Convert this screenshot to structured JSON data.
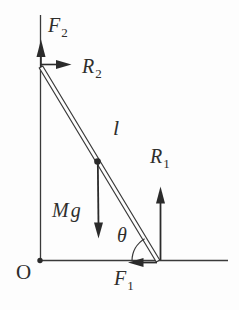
{
  "figure": {
    "kind": "free-body diagram of a ladder leaning against a wall",
    "colors": {
      "line": "#3a3a3a",
      "arrow": "#2b2b2b",
      "background": "#fdfdfd",
      "label": "#2f2e2c"
    },
    "labels": {
      "f2": {
        "base": "F",
        "sub": "2"
      },
      "r2": {
        "base": "R",
        "sub": "2"
      },
      "length": {
        "base": "l",
        "sub": ""
      },
      "r1": {
        "base": "R",
        "sub": "1"
      },
      "mg": {
        "base": "Mg",
        "sub": ""
      },
      "theta": {
        "base": "θ",
        "sub": ""
      },
      "f1": {
        "base": "F",
        "sub": "1"
      },
      "origin": {
        "base": "O",
        "sub": ""
      }
    },
    "arrows": [
      {
        "name": "F2",
        "direction": "up",
        "at": "top end of ladder against wall"
      },
      {
        "name": "R2",
        "direction": "right",
        "at": "top end of ladder against wall"
      },
      {
        "name": "Mg",
        "direction": "down",
        "at": "midpoint of ladder"
      },
      {
        "name": "R1",
        "direction": "up",
        "at": "bottom end of ladder on floor"
      },
      {
        "name": "F1",
        "direction": "left",
        "at": "bottom end of ladder on floor"
      }
    ],
    "angle": {
      "symbol": "θ",
      "between": "ladder and floor"
    }
  }
}
